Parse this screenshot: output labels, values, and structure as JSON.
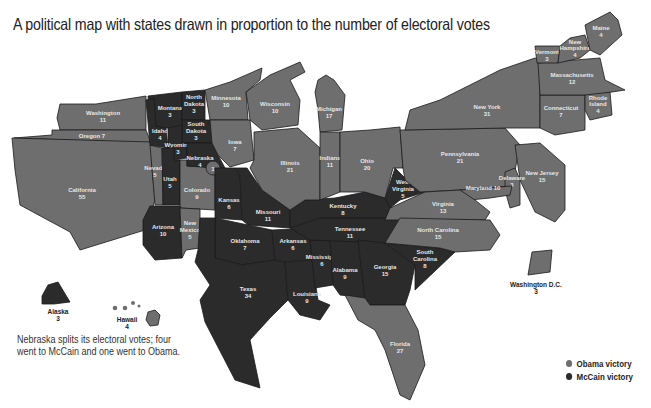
{
  "title": "A political map with states drawn in proportion to the number of electoral votes",
  "note": "Nebraska splits its electoral votes; four went to McCain and one went to Obama.",
  "colors": {
    "obama": "#6e6e6e",
    "mccain": "#2b2b2b",
    "background": "#ffffff"
  },
  "legend": [
    {
      "label": "Obama victory",
      "color": "#6e6e6e"
    },
    {
      "label": "McCain victory",
      "color": "#2b2b2b"
    }
  ],
  "states": {
    "washington": {
      "name": "Washington",
      "votes": "11",
      "winner": "obama"
    },
    "oregon": {
      "name": "Oregon 7",
      "votes": "",
      "winner": "obama"
    },
    "california": {
      "name": "California",
      "votes": "55",
      "winner": "obama"
    },
    "nevada": {
      "name": "Nevada",
      "votes": "5",
      "winner": "obama"
    },
    "idaho": {
      "name": "Idaho",
      "votes": "4",
      "winner": "mccain"
    },
    "montana": {
      "name": "Montana",
      "votes": "3",
      "winner": "mccain"
    },
    "wyoming": {
      "name": "Wyoming",
      "votes": "3",
      "winner": "mccain"
    },
    "utah": {
      "name": "Utah",
      "votes": "5",
      "winner": "mccain"
    },
    "arizona": {
      "name": "Arizona",
      "votes": "10",
      "winner": "mccain"
    },
    "colorado": {
      "name": "Colorado",
      "votes": "9",
      "winner": "obama"
    },
    "new_mexico": {
      "name": "New Mexico",
      "name1": "New",
      "name2": "Mexico",
      "votes": "5",
      "winner": "obama"
    },
    "north_dakota": {
      "name1": "North",
      "name2": "Dakota",
      "votes": "3",
      "winner": "mccain"
    },
    "south_dakota": {
      "name1": "South",
      "name2": "Dakota",
      "votes": "3",
      "winner": "mccain"
    },
    "nebraska": {
      "name": "Nebraska",
      "votes": "4",
      "winner": "mccain",
      "split_votes": "1",
      "split_winner": "obama"
    },
    "kansas": {
      "name": "Kansas",
      "votes": "6",
      "winner": "mccain"
    },
    "oklahoma": {
      "name": "Oklahoma",
      "votes": "7",
      "winner": "mccain"
    },
    "texas": {
      "name": "Texas",
      "votes": "34",
      "winner": "mccain"
    },
    "minnesota": {
      "name": "Minnesota",
      "votes": "10",
      "winner": "obama"
    },
    "iowa": {
      "name": "Iowa",
      "votes": "7",
      "winner": "obama"
    },
    "missouri": {
      "name": "Missouri",
      "votes": "11",
      "winner": "mccain"
    },
    "arkansas": {
      "name": "Arkansas",
      "votes": "6",
      "winner": "mccain"
    },
    "louisiana": {
      "name": "Louisiana",
      "votes": "9",
      "winner": "mccain"
    },
    "wisconsin": {
      "name": "Wisconsin",
      "votes": "10",
      "winner": "obama"
    },
    "illinois": {
      "name": "Illinois",
      "votes": "21",
      "winner": "obama"
    },
    "michigan": {
      "name": "Michigan",
      "votes": "17",
      "winner": "obama"
    },
    "indiana": {
      "name": "Indiana",
      "votes": "11",
      "winner": "obama"
    },
    "ohio": {
      "name": "Ohio",
      "votes": "20",
      "winner": "obama"
    },
    "kentucky": {
      "name": "Kentucky",
      "votes": "8",
      "winner": "mccain"
    },
    "tennessee": {
      "name": "Tennessee",
      "votes": "11",
      "winner": "mccain"
    },
    "mississippi": {
      "name": "Mississippi",
      "votes": "6",
      "winner": "mccain"
    },
    "alabama": {
      "name": "Alabama",
      "votes": "9",
      "winner": "mccain"
    },
    "georgia": {
      "name": "Georgia",
      "votes": "15",
      "winner": "mccain"
    },
    "florida": {
      "name": "Florida",
      "votes": "27",
      "winner": "obama"
    },
    "south_carolina": {
      "name1": "South",
      "name2": "Carolina",
      "votes": "8",
      "winner": "mccain"
    },
    "north_carolina": {
      "name": "North Carolina",
      "votes": "15",
      "winner": "obama"
    },
    "virginia": {
      "name": "Virginia",
      "votes": "13",
      "winner": "obama"
    },
    "west_virginia": {
      "name1": "West",
      "name2": "Virginia",
      "votes": "5",
      "winner": "mccain"
    },
    "maryland": {
      "name": "Maryland 10",
      "votes": "",
      "winner": "obama"
    },
    "delaware": {
      "name": "Delaware",
      "votes": "3",
      "winner": "obama"
    },
    "pennsylvania": {
      "name": "Pennsylvania",
      "votes": "21",
      "winner": "obama"
    },
    "new_jersey": {
      "name": "New Jersey",
      "votes": "15",
      "winner": "obama"
    },
    "new_york": {
      "name": "New York",
      "votes": "31",
      "winner": "obama"
    },
    "connecticut": {
      "name": "Connecticut",
      "votes": "7",
      "winner": "obama"
    },
    "rhode_island": {
      "name1": "Rhode",
      "name2": "Island",
      "votes": "4",
      "winner": "obama"
    },
    "massachusetts": {
      "name": "Massachusetts",
      "votes": "12",
      "winner": "obama"
    },
    "vermont": {
      "name": "Vermont",
      "votes": "3",
      "winner": "obama"
    },
    "new_hampshire": {
      "name1": "New",
      "name2": "Hampshire",
      "votes": "4",
      "winner": "obama"
    },
    "maine": {
      "name": "Maine",
      "votes": "4",
      "winner": "obama"
    },
    "alaska": {
      "name": "Alaska",
      "votes": "3",
      "winner": "mccain"
    },
    "hawaii": {
      "name": "Hawaii",
      "votes": "4",
      "winner": "obama"
    },
    "dc": {
      "name": "Washington D.C.",
      "votes": "3",
      "winner": "obama"
    }
  }
}
